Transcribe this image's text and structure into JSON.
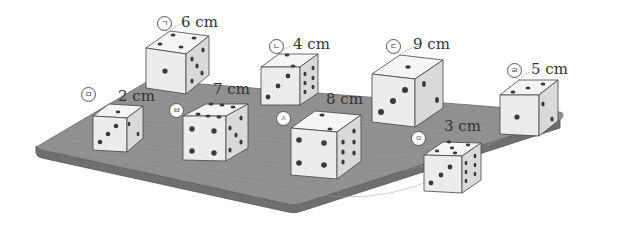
{
  "colors": {
    "table_top": "#8f8f8f",
    "table_edge": "#6e6e6e",
    "die_front": "#ececec",
    "die_top": "#f6f6f6",
    "die_side": "#d8d8d8",
    "pip": "#3a3a3a",
    "text": "#333333"
  },
  "dice": [
    {
      "id": "a",
      "marker": "ㄱ",
      "size_label": "6 cm",
      "top_pips": 4,
      "front_pips": 1,
      "side_pips": 5
    },
    {
      "id": "b",
      "marker": "ㄴ",
      "size_label": "4 cm",
      "top_pips": 2,
      "front_pips": 3,
      "side_pips": 6
    },
    {
      "id": "c",
      "marker": "ㄷ",
      "size_label": "9 cm",
      "top_pips": 1,
      "front_pips": 3,
      "side_pips": 2
    },
    {
      "id": "d",
      "marker": "ㄹ",
      "size_label": "5 cm",
      "top_pips": 3,
      "front_pips": 1,
      "side_pips": 2
    },
    {
      "id": "e",
      "marker": "ㅁ",
      "size_label": "2 cm",
      "top_pips": 1,
      "front_pips": 3,
      "side_pips": 2
    },
    {
      "id": "f",
      "marker": "ㅂ",
      "size_label": "7 cm",
      "top_pips": 6,
      "front_pips": 4,
      "side_pips": 5
    },
    {
      "id": "g",
      "marker": "ㅅ",
      "size_label": "8 cm",
      "top_pips": 2,
      "front_pips": 4,
      "side_pips": 6
    },
    {
      "id": "h",
      "marker": "ㅇ",
      "size_label": "3 cm",
      "top_pips": 5,
      "front_pips": 3,
      "side_pips": 6
    }
  ]
}
